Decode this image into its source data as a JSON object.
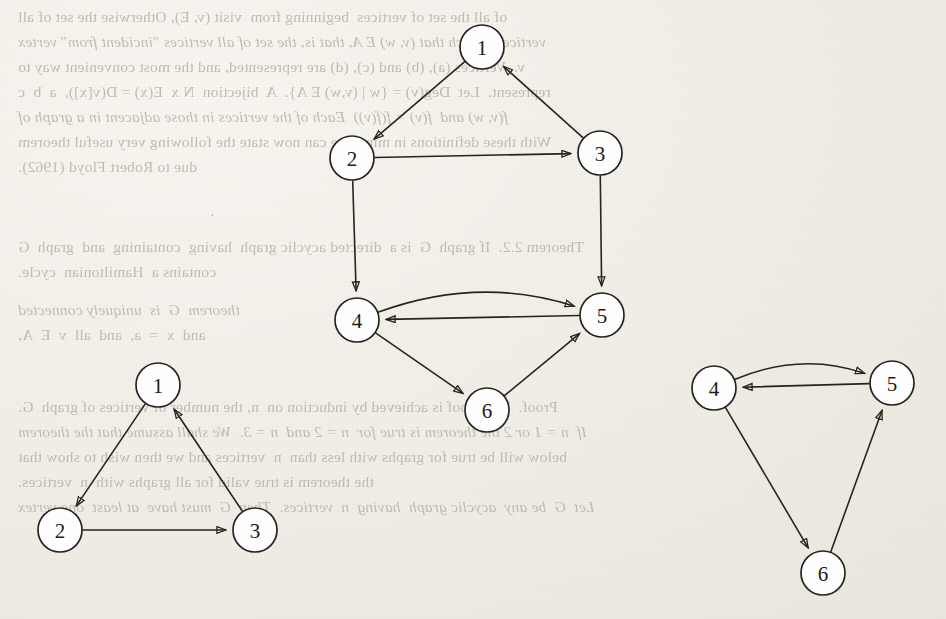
{
  "page": {
    "kind": "scanned-book-page",
    "background_color": "#f3f1ec",
    "ink_color": "#25231f",
    "showthrough_color": "#b9b2a4",
    "note": "Directed graph figures on a scanned page; faint mirrored text bleeds through from the reverse side."
  },
  "showthrough_text": {
    "description": "Mirror-reversed text visible through the paper",
    "lines": [
      {
        "id": "l1",
        "x": 18,
        "y": 4,
        "text": "of all the set of vertices  beginning from  visit (v, E), Otherwise the set of all"
      },
      {
        "id": "l2",
        "x": 18,
        "y": 29,
        "text": "vertices w such that (v, w) E A, that is, the set of all vertices \"incident from\" vertex"
      },
      {
        "id": "l3",
        "x": 18,
        "y": 54,
        "text": "v.  Vertices (a), (b) and (c), (d) are represented, and the most convenient way to"
      },
      {
        "id": "l4",
        "x": 18,
        "y": 79,
        "text": "represent.  Let  Deg(v) = {w | (v,w) E A}.  A  bijection  N x  E(x) = D(v[x]),  a  b  c"
      },
      {
        "id": "l5",
        "x": 18,
        "y": 104,
        "text": "f(v, w) and  f(v) = f(f(v))  Each of the vertices in those adjacent in a graph of"
      },
      {
        "id": "l6",
        "x": 18,
        "y": 129,
        "text": "With these definitions in mind, we can now state the following very useful theorem"
      },
      {
        "id": "l7",
        "x": 18,
        "y": 154,
        "text": "due to Robert Floyd (1962)."
      },
      {
        "id": "l8",
        "x": 210,
        "y": 198,
        "text": "."
      },
      {
        "id": "l9",
        "x": 18,
        "y": 234,
        "text": "Theorem 2.2.  If graph  G  is a  directed acyclic graph  having  containing  and  graph  G"
      },
      {
        "id": "l10",
        "x": 18,
        "y": 259,
        "text": "contains a  Hamiltonian  cycle."
      },
      {
        "id": "l11",
        "x": 18,
        "y": 297,
        "text": "theorem  G  is  uniquely connected"
      },
      {
        "id": "l12",
        "x": 18,
        "y": 322,
        "text": "and  x  =  a,  and  all  v  E  A,"
      },
      {
        "id": "l13",
        "x": 18,
        "y": 394,
        "text": "Proof.  The proof is achieved by induction on  n, the number of vertices of graph  G."
      },
      {
        "id": "l14",
        "x": 18,
        "y": 419,
        "text": "If  n = 1 or 2 the theorem is true for  n = 2 and  n = 3.  We shall assume that the theorem"
      },
      {
        "id": "l15",
        "x": 18,
        "y": 444,
        "text": "below will be true for graphs with less than  n  vertices and we then wish to show that"
      },
      {
        "id": "l16",
        "x": 18,
        "y": 469,
        "text": "the theorem is true valid for all graphs with  n  vertices."
      },
      {
        "id": "l17",
        "x": 18,
        "y": 494,
        "text": "Let  G  be any  acyclic graph  having  n  vertices.  Then  G  must have  at least  one vertex"
      }
    ]
  },
  "figures": [
    {
      "id": "figure-main",
      "name": "main-digraph",
      "node_radius": 22,
      "nodes": [
        {
          "id": "n1",
          "label": "1",
          "cx": 482,
          "cy": 47
        },
        {
          "id": "n2",
          "label": "2",
          "cx": 352,
          "cy": 158
        },
        {
          "id": "n3",
          "label": "3",
          "cx": 600,
          "cy": 153
        },
        {
          "id": "n4",
          "label": "4",
          "cx": 357,
          "cy": 320
        },
        {
          "id": "n5",
          "label": "5",
          "cx": 602,
          "cy": 315
        },
        {
          "id": "n6",
          "label": "6",
          "cx": 487,
          "cy": 410
        }
      ],
      "edges": [
        {
          "id": "e1",
          "from": "n1",
          "to": "n2",
          "shape": "straight",
          "label": "1 to 2"
        },
        {
          "id": "e2",
          "from": "n2",
          "to": "n3",
          "shape": "straight",
          "label": "2 to 3"
        },
        {
          "id": "e3",
          "from": "n3",
          "to": "n1",
          "shape": "straight",
          "label": "3 to 1"
        },
        {
          "id": "e4",
          "from": "n2",
          "to": "n4",
          "shape": "straight",
          "label": "2 to 4"
        },
        {
          "id": "e5",
          "from": "n3",
          "to": "n5",
          "shape": "straight",
          "label": "3 to 5"
        },
        {
          "id": "e6",
          "from": "n4",
          "to": "n5",
          "shape": "curved",
          "curve": -42,
          "label": "4 to 5"
        },
        {
          "id": "e7",
          "from": "n5",
          "to": "n4",
          "shape": "straight",
          "label": "5 to 4"
        },
        {
          "id": "e8",
          "from": "n4",
          "to": "n6",
          "shape": "straight",
          "label": "4 to 6"
        },
        {
          "id": "e9",
          "from": "n6",
          "to": "n5",
          "shape": "straight",
          "label": "6 to 5"
        }
      ]
    },
    {
      "id": "figure-left",
      "name": "left-triangle-digraph",
      "node_radius": 22,
      "nodes": [
        {
          "id": "n1",
          "label": "1",
          "cx": 158,
          "cy": 385
        },
        {
          "id": "n2",
          "label": "2",
          "cx": 60,
          "cy": 530
        },
        {
          "id": "n3",
          "label": "3",
          "cx": 255,
          "cy": 530
        }
      ],
      "edges": [
        {
          "id": "e1",
          "from": "n1",
          "to": "n2",
          "shape": "straight",
          "label": "1 to 2"
        },
        {
          "id": "e2",
          "from": "n2",
          "to": "n3",
          "shape": "straight",
          "label": "2 to 3"
        },
        {
          "id": "e3",
          "from": "n3",
          "to": "n1",
          "shape": "straight",
          "label": "3 to 1"
        }
      ]
    },
    {
      "id": "figure-right",
      "name": "right-triangle-digraph",
      "node_radius": 22,
      "nodes": [
        {
          "id": "n4",
          "label": "4",
          "cx": 714,
          "cy": 388
        },
        {
          "id": "n5",
          "label": "5",
          "cx": 892,
          "cy": 383
        },
        {
          "id": "n6",
          "label": "6",
          "cx": 823,
          "cy": 573
        }
      ],
      "edges": [
        {
          "id": "e1",
          "from": "n4",
          "to": "n5",
          "shape": "curved",
          "curve": -34,
          "label": "4 to 5"
        },
        {
          "id": "e2",
          "from": "n5",
          "to": "n4",
          "shape": "straight",
          "label": "5 to 4"
        },
        {
          "id": "e3",
          "from": "n4",
          "to": "n6",
          "shape": "straight",
          "label": "4 to 6"
        },
        {
          "id": "e4",
          "from": "n6",
          "to": "n5",
          "shape": "straight",
          "label": "6 to 5"
        }
      ]
    }
  ]
}
